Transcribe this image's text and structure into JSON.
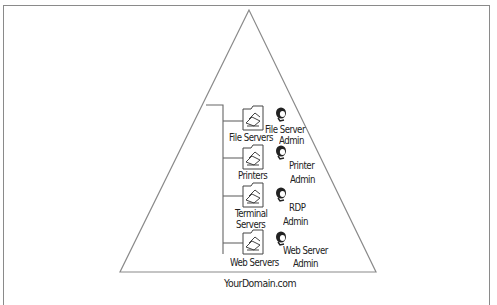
{
  "caption": "Figure ... (cropped)",
  "domain_label": "YourDomain.com",
  "tree": {
    "items": [
      {
        "container": "File Servers",
        "container_lines": [
          "File Servers"
        ],
        "admin_lines": [
          "File Server",
          "Admin"
        ]
      },
      {
        "container": "Printers",
        "container_lines": [
          "Printers"
        ],
        "admin_lines": [
          "Printer",
          "Admin"
        ]
      },
      {
        "container": "Terminal Servers",
        "container_lines": [
          "Terminal",
          "Servers"
        ],
        "admin_lines": [
          "RDP",
          "Admin"
        ]
      },
      {
        "container": "Web Servers",
        "container_lines": [
          "Web Servers"
        ],
        "admin_lines": [
          "Web Server",
          "Admin"
        ]
      }
    ]
  },
  "icons": {
    "container": "ou-folder-icon",
    "admin": "admin-user-icon"
  },
  "colors": {
    "line": "#8a8a8a",
    "icon": "#444444",
    "text": "#222222"
  }
}
